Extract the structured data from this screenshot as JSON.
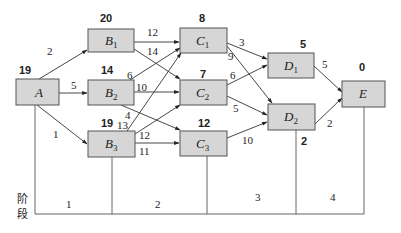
{
  "diagram": {
    "type": "dynamic-programming-shortest-path-network",
    "nodes": [
      {
        "id": "A",
        "letter": "A",
        "sub": "",
        "value": "19"
      },
      {
        "id": "B1",
        "letter": "B",
        "sub": "1",
        "value": "20"
      },
      {
        "id": "B2",
        "letter": "B",
        "sub": "2",
        "value": "14"
      },
      {
        "id": "B3",
        "letter": "B",
        "sub": "3",
        "value": "19"
      },
      {
        "id": "C1",
        "letter": "C",
        "sub": "1",
        "value": "8"
      },
      {
        "id": "C2",
        "letter": "C",
        "sub": "2",
        "value": "7"
      },
      {
        "id": "C3",
        "letter": "C",
        "sub": "3",
        "value": "12"
      },
      {
        "id": "D1",
        "letter": "D",
        "sub": "1",
        "value": "5"
      },
      {
        "id": "D2",
        "letter": "D",
        "sub": "2",
        "value": "2"
      },
      {
        "id": "E",
        "letter": "E",
        "sub": "",
        "value": "0"
      }
    ],
    "edges": [
      {
        "from": "A",
        "to": "B1",
        "weight": "2"
      },
      {
        "from": "A",
        "to": "B2",
        "weight": "5"
      },
      {
        "from": "A",
        "to": "B3",
        "weight": "1"
      },
      {
        "from": "B1",
        "to": "C1",
        "weight": "12"
      },
      {
        "from": "B1",
        "to": "C2",
        "weight": "14"
      },
      {
        "from": "B2",
        "to": "C1",
        "weight": "6"
      },
      {
        "from": "B2",
        "to": "C2",
        "weight": "10"
      },
      {
        "from": "B2",
        "to": "C3",
        "weight": "4"
      },
      {
        "from": "B3",
        "to": "C1",
        "weight": "13"
      },
      {
        "from": "B3",
        "to": "C2",
        "weight": "12"
      },
      {
        "from": "B3",
        "to": "C3",
        "weight": "11"
      },
      {
        "from": "C1",
        "to": "D1",
        "weight": "3"
      },
      {
        "from": "C1",
        "to": "D2",
        "weight": "9"
      },
      {
        "from": "C2",
        "to": "D1",
        "weight": "6"
      },
      {
        "from": "C2",
        "to": "D2",
        "weight": "5"
      },
      {
        "from": "C3",
        "to": "D2",
        "weight": "10"
      },
      {
        "from": "D1",
        "to": "E",
        "weight": "5"
      },
      {
        "from": "D2",
        "to": "E",
        "weight": "2"
      }
    ],
    "stages": {
      "title_line1": "阶",
      "title_line2": "段",
      "labels": [
        "1",
        "2",
        "3",
        "4"
      ]
    }
  }
}
